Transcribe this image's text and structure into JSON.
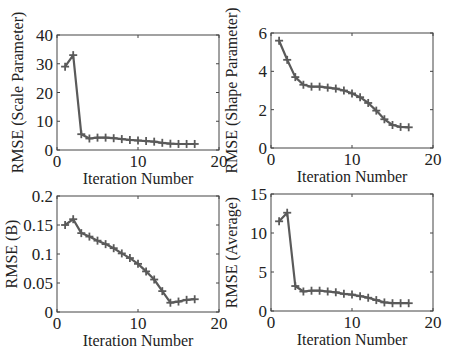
{
  "figure": {
    "width": 453,
    "height": 354,
    "line_color": "#5a5a5a",
    "marker": "plus",
    "axis_color": "#444444"
  },
  "chart_data": [
    {
      "id": "scale",
      "type": "line",
      "title": "",
      "xlabel": "Iteration Number",
      "ylabel": "RMSE (Scale Parameter)",
      "xlim": [
        0,
        20
      ],
      "ylim": [
        0,
        40
      ],
      "xticks": [
        0,
        10,
        20
      ],
      "yticks": [
        0,
        10,
        20,
        30,
        40
      ],
      "xtick_labels": [
        "0",
        "10",
        "20"
      ],
      "ytick_labels": [
        "0",
        "10",
        "20",
        "30",
        "40"
      ],
      "grid": false,
      "legend": null,
      "x": [
        1,
        2,
        3,
        4,
        5,
        6,
        7,
        8,
        9,
        10,
        11,
        12,
        13,
        14,
        15,
        16,
        17
      ],
      "values": [
        29,
        33,
        5.5,
        4.0,
        4.3,
        4.3,
        4.1,
        3.8,
        3.5,
        3.3,
        3.1,
        2.9,
        2.5,
        2.2,
        2.1,
        2.1,
        2.1
      ]
    },
    {
      "id": "shape",
      "type": "line",
      "title": "",
      "xlabel": "Iteration Number",
      "ylabel": "RMSE (Shape Parameter)",
      "xlim": [
        0,
        20
      ],
      "ylim": [
        0,
        6
      ],
      "xticks": [
        0,
        10,
        20
      ],
      "yticks": [
        0,
        2,
        4,
        6
      ],
      "xtick_labels": [
        "0",
        "10",
        "20"
      ],
      "ytick_labels": [
        "0",
        "2",
        "4",
        "6"
      ],
      "grid": false,
      "legend": null,
      "x": [
        1,
        2,
        3,
        4,
        5,
        6,
        7,
        8,
        9,
        10,
        11,
        12,
        13,
        14,
        15,
        16,
        17
      ],
      "values": [
        5.6,
        4.6,
        3.7,
        3.3,
        3.2,
        3.2,
        3.15,
        3.1,
        3.0,
        2.85,
        2.65,
        2.35,
        1.95,
        1.5,
        1.2,
        1.1,
        1.08
      ]
    },
    {
      "id": "b",
      "type": "line",
      "title": "",
      "xlabel": "Iteration Number",
      "ylabel": "RMSE (B)",
      "xlim": [
        0,
        20
      ],
      "ylim": [
        0,
        0.2
      ],
      "xticks": [
        0,
        10,
        20
      ],
      "yticks": [
        0,
        0.05,
        0.1,
        0.15,
        0.2
      ],
      "xtick_labels": [
        "0",
        "10",
        "20"
      ],
      "ytick_labels": [
        "0",
        "0.05",
        "0.1",
        "0.15",
        "0.2"
      ],
      "grid": false,
      "legend": null,
      "x": [
        1,
        2,
        3,
        4,
        5,
        6,
        7,
        8,
        9,
        10,
        11,
        12,
        13,
        14,
        15,
        16,
        17
      ],
      "values": [
        0.15,
        0.16,
        0.136,
        0.13,
        0.123,
        0.117,
        0.11,
        0.101,
        0.093,
        0.083,
        0.07,
        0.056,
        0.036,
        0.016,
        0.018,
        0.021,
        0.022
      ]
    },
    {
      "id": "average",
      "type": "line",
      "title": "",
      "xlabel": "Iteration Number",
      "ylabel": "RMSE (Average)",
      "xlim": [
        0,
        20
      ],
      "ylim": [
        0,
        15
      ],
      "xticks": [
        0,
        10,
        20
      ],
      "yticks": [
        0,
        5,
        10,
        15
      ],
      "xtick_labels": [
        "0",
        "10",
        "20"
      ],
      "ytick_labels": [
        "0",
        "5",
        "10",
        "15"
      ],
      "grid": false,
      "legend": null,
      "x": [
        1,
        2,
        3,
        4,
        5,
        6,
        7,
        8,
        9,
        10,
        11,
        12,
        13,
        14,
        15,
        16,
        17
      ],
      "values": [
        11.5,
        12.6,
        3.2,
        2.5,
        2.6,
        2.6,
        2.5,
        2.4,
        2.2,
        2.1,
        1.9,
        1.7,
        1.4,
        1.1,
        1.0,
        1.0,
        1.0
      ]
    }
  ],
  "layout": {
    "panels": [
      {
        "left": 57,
        "top": 35,
        "width": 162,
        "height": 115
      },
      {
        "left": 271,
        "top": 33,
        "width": 162,
        "height": 115
      },
      {
        "left": 57,
        "top": 196,
        "width": 162,
        "height": 116
      },
      {
        "left": 271,
        "top": 194,
        "width": 162,
        "height": 117
      }
    ]
  }
}
